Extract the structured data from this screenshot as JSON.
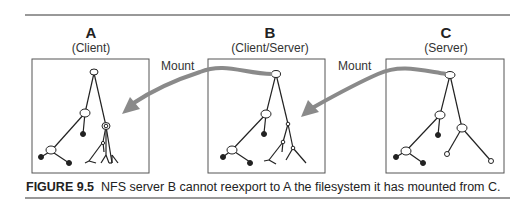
{
  "figure": {
    "number_label": "FIGURE 9.5",
    "caption_text": "NFS server B cannot reexport to A the filesystem it has mounted from C."
  },
  "machines": [
    {
      "letter": "A",
      "role": "(Client)"
    },
    {
      "letter": "B",
      "role": "(Client/Server)"
    },
    {
      "letter": "C",
      "role": "(Server)"
    }
  ],
  "arrows": [
    {
      "label": "Mount",
      "from": "B",
      "to": "A"
    },
    {
      "label": "Mount",
      "from": "C",
      "to": "B"
    }
  ],
  "colors": {
    "arrow": "#8a8a8a",
    "line": "#222222",
    "box_border": "#555555",
    "rule": "#333333"
  }
}
